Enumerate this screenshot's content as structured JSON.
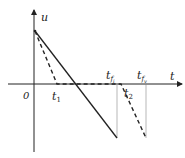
{
  "diagram": {
    "axes": {
      "y_label": "u",
      "x_label": "t",
      "origin_label": "0"
    },
    "time_labels": {
      "t1": {
        "base": "t",
        "sub": "1"
      },
      "t2": {
        "base": "t",
        "sub": "2"
      },
      "tfi": {
        "base": "t",
        "sub": "f",
        "subsub": "i"
      },
      "tfv": {
        "base": "t",
        "sub": "f",
        "subsub": "v"
      }
    },
    "lines": [
      {
        "name": "solid-ramp",
        "style": "solid",
        "from": [
          35,
          31
        ],
        "to": [
          117,
          138
        ]
      },
      {
        "name": "dashed-ramp-1",
        "style": "dashed",
        "from": [
          35,
          31
        ],
        "to": [
          57,
          84
        ]
      },
      {
        "name": "dashed-flat",
        "style": "dashed",
        "from": [
          57,
          84
        ],
        "to": [
          121,
          84
        ]
      },
      {
        "name": "dashed-ramp-2",
        "style": "dashed",
        "from": [
          121,
          84
        ],
        "to": [
          146,
          138
        ]
      }
    ],
    "colors": {
      "line": "#222222",
      "guide": "#888888"
    }
  }
}
